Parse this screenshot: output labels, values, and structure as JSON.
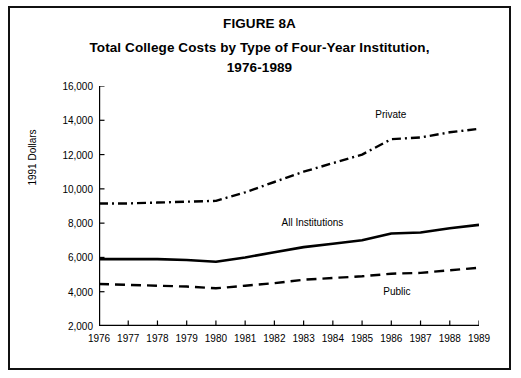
{
  "figure": {
    "title_lines": [
      "FIGURE 8A",
      "Total College Costs by Type of Four-Year Institution,",
      "1976-1989"
    ]
  },
  "chart_data": {
    "type": "line",
    "title": "Total College Costs by Type of Four-Year Institution, 1976-1989",
    "xlabel": "",
    "ylabel": "1991 Dollars",
    "x": [
      "1976",
      "1977",
      "1978",
      "1979",
      "1980",
      "1981",
      "1982",
      "1983",
      "1984",
      "1985",
      "1986",
      "1987",
      "1988",
      "1989"
    ],
    "xlim": [
      1976,
      1989
    ],
    "ylim": [
      2000,
      16000
    ],
    "yticks": [
      "2,000",
      "4,000",
      "6,000",
      "8,000",
      "10,000",
      "12,000",
      "14,000",
      "16,000"
    ],
    "ytick_values": [
      2000,
      4000,
      6000,
      8000,
      10000,
      12000,
      14000,
      16000
    ],
    "grid": false,
    "legend_position": "inline-annotations",
    "series": [
      {
        "name": "Private",
        "label": "Private",
        "style": "dash-dot",
        "values": [
          9150,
          9150,
          9200,
          9250,
          9300,
          9800,
          10400,
          11000,
          11500,
          12000,
          12900,
          13000,
          13300,
          13500
        ]
      },
      {
        "name": "All Institutions",
        "label": "All Institutions",
        "style": "solid",
        "values": [
          5900,
          5900,
          5900,
          5850,
          5750,
          6000,
          6300,
          6600,
          6800,
          7000,
          7400,
          7450,
          7700,
          7900
        ]
      },
      {
        "name": "Public",
        "label": "Public",
        "style": "dashed",
        "values": [
          4450,
          4400,
          4350,
          4300,
          4200,
          4350,
          4500,
          4700,
          4800,
          4900,
          5050,
          5100,
          5250,
          5400
        ]
      }
    ]
  }
}
